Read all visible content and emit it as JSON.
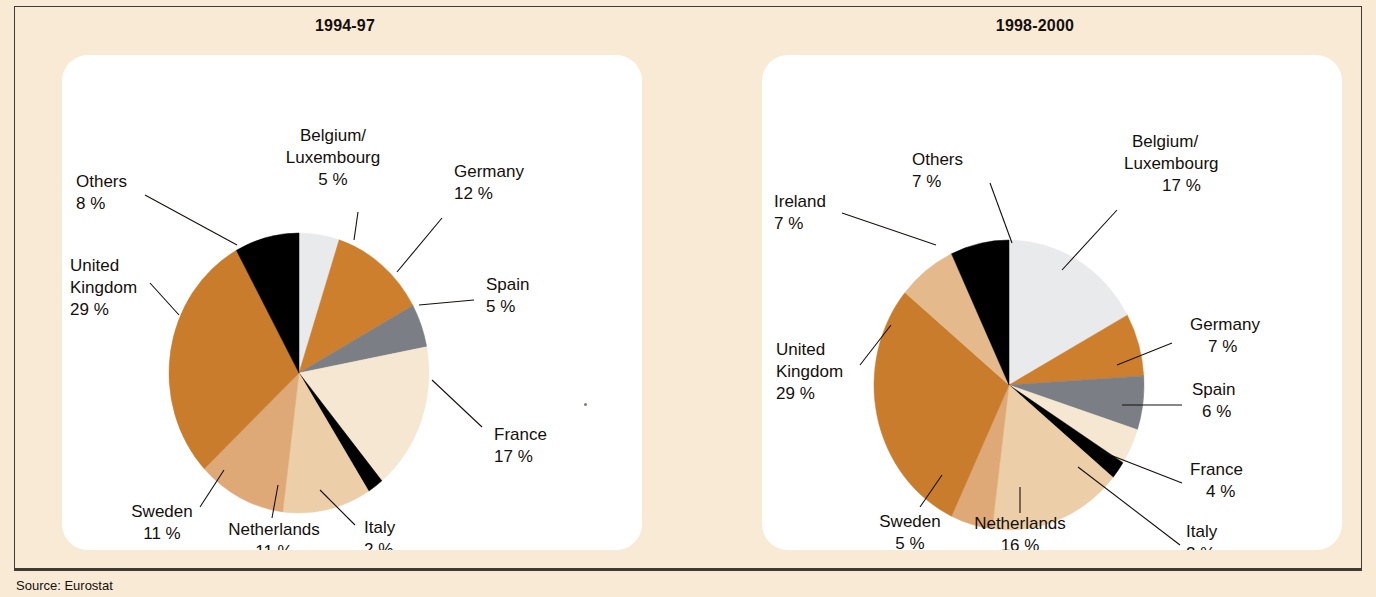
{
  "figure": {
    "background_color": "#f9ead6",
    "frame_color": "#403a33",
    "panel_color": "#ffffff",
    "source_label": "Source: Eurostat"
  },
  "palette": {
    "belgium_luxembourg": "#e8eaec",
    "germany": "#cd7f2e",
    "spain": "#7b7e84",
    "france": "#f6e7d2",
    "italy": "#000000",
    "netherlands": "#eccfa8",
    "sweden": "#dfa977",
    "united_kingdom": "#c87c2c",
    "ireland": "#e4b98c",
    "others": "#000000"
  },
  "charts": [
    {
      "id": "chart-1994-97",
      "title": "1994-97",
      "labels": [
        {
          "name": "Belgium/",
          "name2": "Luxembourg",
          "value": "5 %"
        },
        {
          "name": "Germany",
          "name2": "",
          "value": "12 %"
        },
        {
          "name": "Spain",
          "name2": "",
          "value": "5 %"
        },
        {
          "name": "France",
          "name2": "",
          "value": "17 %"
        },
        {
          "name": "Italy",
          "name2": "",
          "value": "2 %"
        },
        {
          "name": "Netherlands",
          "name2": "",
          "value": "11 %"
        },
        {
          "name": "Sweden",
          "name2": "",
          "value": "11 %"
        },
        {
          "name": "United",
          "name2": "Kingdom",
          "value": "29 %"
        },
        {
          "name": "Others",
          "name2": "",
          "value": "8 %"
        }
      ]
    },
    {
      "id": "chart-1998-2000",
      "title": "1998-2000",
      "labels": [
        {
          "name": "Belgium/",
          "name2": "Luxembourg",
          "value": "17 %"
        },
        {
          "name": "Germany",
          "name2": "",
          "value": "7 %"
        },
        {
          "name": "Spain",
          "name2": "",
          "value": "6 %"
        },
        {
          "name": "France",
          "name2": "",
          "value": "4 %"
        },
        {
          "name": "Italy",
          "name2": "",
          "value": "2 %"
        },
        {
          "name": "Netherlands",
          "name2": "",
          "value": "16 %"
        },
        {
          "name": "Sweden",
          "name2": "",
          "value": "5 %"
        },
        {
          "name": "United",
          "name2": "Kingdom",
          "value": "29 %"
        },
        {
          "name": "Ireland",
          "name2": "",
          "value": "7 %"
        },
        {
          "name": "Others",
          "name2": "",
          "value": "7 %"
        }
      ]
    }
  ],
  "chart_data": [
    {
      "type": "pie",
      "title": "1994-97",
      "categories": [
        "Belgium/Luxembourg",
        "Germany",
        "Spain",
        "France",
        "Italy",
        "Netherlands",
        "Sweden",
        "United Kingdom",
        "Others"
      ],
      "values": [
        5,
        12,
        5,
        17,
        2,
        11,
        11,
        29,
        8
      ],
      "unit": "%",
      "colors": [
        "#e8eaec",
        "#cd7f2e",
        "#7b7e84",
        "#f6e7d2",
        "#000000",
        "#eccfa8",
        "#dfa977",
        "#c87c2c",
        "#000000"
      ],
      "start_angle_deg": 0,
      "direction": "clockwise",
      "legend": "labels-with-leader-lines",
      "grid": false
    },
    {
      "type": "pie",
      "title": "1998-2000",
      "categories": [
        "Belgium/Luxembourg",
        "Germany",
        "Spain",
        "France",
        "Italy",
        "Netherlands",
        "Sweden",
        "United Kingdom",
        "Ireland",
        "Others"
      ],
      "values": [
        17,
        7,
        6,
        4,
        2,
        16,
        5,
        29,
        7,
        7
      ],
      "unit": "%",
      "colors": [
        "#e8eaec",
        "#cd7f2e",
        "#7b7e84",
        "#f6e7d2",
        "#000000",
        "#eccfa8",
        "#dfa977",
        "#c87c2c",
        "#e4b98c",
        "#000000"
      ],
      "start_angle_deg": 0,
      "direction": "clockwise",
      "legend": "labels-with-leader-lines",
      "grid": false
    }
  ]
}
